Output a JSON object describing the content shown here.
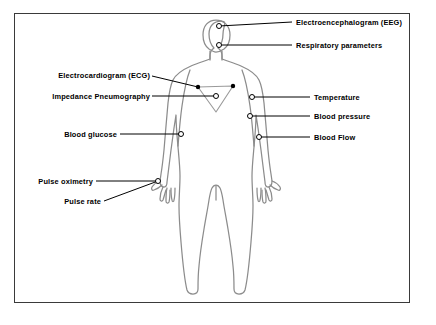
{
  "diagram": {
    "background_color": "#ffffff",
    "frame_color": "#3a3a3a",
    "body_outline_color": "#8c8c8c",
    "leader_line_color": "#000000",
    "marker_open_color": "#ffffff",
    "marker_stroke_color": "#000000",
    "marker_filled_color": "#000000"
  },
  "labels": {
    "eeg": "Electroencephalogram (EEG)",
    "respiratory": "Respiratory parameters",
    "ecg": "Electrocardiogram (ECG)",
    "impedance": "Impedance Pneumography",
    "temperature": "Temperature",
    "blood_pressure": "Blood pressure",
    "blood_flow": "Blood Flow",
    "blood_glucose": "Blood glucose",
    "pulse_oximetry": "Pulse oximetry",
    "pulse_rate": "Pulse rate"
  },
  "callouts": [
    {
      "id": "eeg",
      "label": "Electroencephalogram (EEG)",
      "side": "right",
      "marker": "open-circle",
      "body_site": "top-of-head"
    },
    {
      "id": "respiratory",
      "label": "Respiratory parameters",
      "side": "right",
      "marker": "open-circle",
      "body_site": "face-nose"
    },
    {
      "id": "ecg",
      "label": "Electrocardiogram (ECG)",
      "side": "left",
      "marker": "filled-dot-pair",
      "body_site": "chest-electrodes"
    },
    {
      "id": "impedance",
      "label": "Impedance Pneumography",
      "side": "left",
      "marker": "open-circle",
      "body_site": "chest-center"
    },
    {
      "id": "temperature",
      "label": "Temperature",
      "side": "right",
      "marker": "open-circle",
      "body_site": "armpit"
    },
    {
      "id": "blood_pressure",
      "label": "Blood pressure",
      "side": "right",
      "marker": "open-circle",
      "body_site": "upper-arm"
    },
    {
      "id": "blood_flow",
      "label": "Blood Flow",
      "side": "right",
      "marker": "open-circle",
      "body_site": "forearm"
    },
    {
      "id": "blood_glucose",
      "label": "Blood glucose",
      "side": "left",
      "marker": "open-circle",
      "body_site": "left-forearm"
    },
    {
      "id": "pulse_oximetry",
      "label": "Pulse oximetry",
      "side": "left",
      "marker": "open-circle",
      "body_site": "left-hand"
    },
    {
      "id": "pulse_rate",
      "label": "Pulse rate",
      "side": "left",
      "marker": "open-circle",
      "body_site": "left-hand"
    }
  ]
}
